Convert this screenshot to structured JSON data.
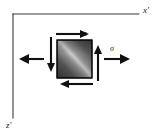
{
  "figure": {
    "kind": "stress-element-diagram",
    "background_color": "#ffffff",
    "width": 157,
    "height": 132
  },
  "axes": {
    "horizontal": {
      "name": "x-prime-axis",
      "label": "x′",
      "label_x": 143,
      "label_y": 13,
      "x1": 13,
      "y1": 14,
      "x2": 139,
      "y2": 14,
      "color": "#3a3a3a"
    },
    "vertical": {
      "name": "z-prime-axis",
      "label": "z′",
      "label_x": 9,
      "label_y": 127,
      "x1": 13,
      "y1": 14,
      "x2": 13,
      "y2": 118,
      "color": "#3a3a3a"
    }
  },
  "element": {
    "name": "stress-element-square",
    "x": 57,
    "y": 40,
    "width": 35,
    "height": 38,
    "fill_dark": "#3c3c3c",
    "fill_mid": "#6e6e6e",
    "fill_light": "#d8d8d8",
    "stroke": "#000000"
  },
  "stress_labels": {
    "shear": {
      "name": "tau-label",
      "symbol": "τ",
      "x": 86,
      "y": 35,
      "meaning": "shear-stress"
    },
    "normal": {
      "name": "sigma-label",
      "symbol": "σ",
      "x": 112,
      "y": 50,
      "meaning": "normal-stress"
    }
  },
  "arrows": [
    {
      "name": "shear-arrow-top",
      "direction": "right",
      "kind": "shear",
      "x1": 56,
      "y1": 34,
      "x2": 88,
      "y2": 34
    },
    {
      "name": "shear-arrow-bottom",
      "direction": "left",
      "kind": "shear",
      "x1": 93,
      "y1": 84,
      "x2": 61,
      "y2": 84
    },
    {
      "name": "shear-arrow-left",
      "direction": "down",
      "kind": "shear",
      "x1": 51,
      "y1": 37,
      "x2": 51,
      "y2": 70
    },
    {
      "name": "shear-arrow-right",
      "direction": "up",
      "kind": "shear",
      "x1": 98,
      "y1": 79,
      "x2": 98,
      "y2": 46
    },
    {
      "name": "normal-arrow-left",
      "direction": "left",
      "kind": "normal",
      "x1": 44,
      "y1": 59,
      "x2": 20,
      "y2": 59
    },
    {
      "name": "normal-arrow-right",
      "direction": "right",
      "kind": "normal",
      "x1": 104,
      "y1": 59,
      "x2": 130,
      "y2": 59
    }
  ]
}
